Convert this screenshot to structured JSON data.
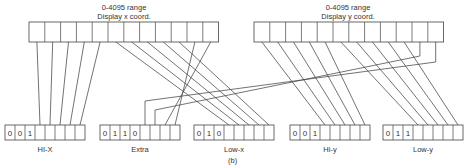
{
  "diagram": {
    "caption": "(b)",
    "top_registers": [
      {
        "id": "x",
        "title_line1": "0-4095 range",
        "title_line2": "Display x coord.",
        "bits": 12
      },
      {
        "id": "y",
        "title_line1": "0-4095 range",
        "title_line2": "Display y coord.",
        "bits": 12
      }
    ],
    "bottom_bytes": [
      {
        "id": "hi-x",
        "label": "HI-X",
        "prefix": [
          "0",
          "0",
          "1"
        ],
        "cells": 8
      },
      {
        "id": "extra",
        "label": "Extra",
        "prefix": [
          "0",
          "1",
          "1",
          "0"
        ],
        "cells": 8
      },
      {
        "id": "low-x",
        "label": "Low-x",
        "prefix": [
          "0",
          "1",
          "0"
        ],
        "cells": 8
      },
      {
        "id": "hi-y",
        "label": "Hi-y",
        "prefix": [
          "0",
          "0",
          "1"
        ],
        "cells": 8
      },
      {
        "id": "low-y",
        "label": "Low-y",
        "prefix": [
          "0",
          "1",
          "1"
        ],
        "cells": 8
      }
    ],
    "connections": [
      {
        "from": "x bits 0-4",
        "to": "HI-X bits 3-7"
      },
      {
        "from": "x bits 5-9",
        "to": "Low-x bits 3-7"
      },
      {
        "from": "x bits 10-11",
        "to": "Extra bits 6-7"
      },
      {
        "from": "y bits 0-4",
        "to": "Hi-y bits 3-7"
      },
      {
        "from": "y bits 5-9",
        "to": "Low-y bits 3-7"
      },
      {
        "from": "y bits 10-11",
        "to": "Extra bits 4-5"
      }
    ],
    "colors": {
      "line": "#444444",
      "text": "#333333",
      "background": "#ffffff"
    }
  }
}
